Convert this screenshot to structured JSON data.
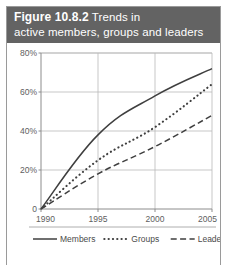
{
  "figure": {
    "header_line1_strong": "Figure 10.8.2",
    "header_line1_rest": "Trends in",
    "header_line2": "active members, groups and leaders",
    "header_bg": "#636363",
    "header_text_color": "#ffffff",
    "border_color": "#9a9a9a"
  },
  "chart_data": {
    "type": "line",
    "title": "Trends in active members, groups and leaders",
    "xlabel": "",
    "ylabel": "",
    "x": [
      1990,
      1995,
      2000,
      2005
    ],
    "xlim": [
      1990,
      2005
    ],
    "ylim": [
      0,
      80
    ],
    "ytick_labels": [
      "0",
      "20%",
      "40%",
      "60%",
      "80%"
    ],
    "ytick_values": [
      0,
      20,
      40,
      60,
      80
    ],
    "xtick_labels": [
      "1990",
      "1995",
      "2000",
      "2005"
    ],
    "grid": true,
    "legend_position": "bottom",
    "series": [
      {
        "name": "Members",
        "style": "solid",
        "color": "#3f3f3f",
        "values": [
          0,
          38,
          58,
          72
        ]
      },
      {
        "name": "Groups",
        "style": "dotted",
        "color": "#3f3f3f",
        "values": [
          0,
          25,
          42,
          64
        ]
      },
      {
        "name": "Leaders",
        "style": "dashed",
        "color": "#3f3f3f",
        "values": [
          0,
          18,
          32,
          48
        ]
      }
    ]
  }
}
